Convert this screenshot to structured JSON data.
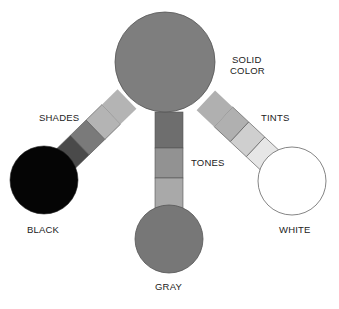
{
  "diagram": {
    "nodes": {
      "solid": {
        "label_line1": "SOLID",
        "label_line2": "COLOR",
        "fill": "#7e7e7e"
      },
      "black": {
        "label": "BLACK",
        "fill": "#050505"
      },
      "gray": {
        "label": "GRAY",
        "fill": "#777777"
      },
      "white": {
        "label": "WHITE",
        "fill": "#ffffff"
      }
    },
    "bars": {
      "shades": {
        "label": "SHADES",
        "segments": [
          "#b4b4b4",
          "#7a7a7a",
          "#4a4a4a"
        ]
      },
      "tones": {
        "label": "TONES",
        "segments": [
          "#6e6e6e",
          "#929292",
          "#a9a9a9"
        ]
      },
      "tints": {
        "label": "TINTS",
        "segments": [
          "#b0b0b0",
          "#cfcfcf",
          "#e6e6e6"
        ]
      }
    },
    "stroke": "#555555"
  }
}
